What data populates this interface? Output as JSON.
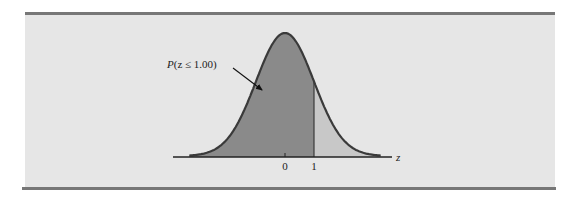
{
  "figure": {
    "annotation": {
      "prefix": "P",
      "text": "(z ≤ 1.00)",
      "full": "P(z ≤ 1.00)"
    },
    "axis": {
      "variable_label": "z",
      "ticks": [
        {
          "label": "0",
          "value": 0
        },
        {
          "label": "1",
          "value": 1
        }
      ]
    },
    "colors": {
      "panel_background": "#e6e6e6",
      "shaded_area": "#8a8a8a",
      "unshaded_area": "#c8c8c8",
      "curve": "#3a3a3a",
      "rules": "#777777"
    }
  },
  "chart_data": {
    "type": "area",
    "title": "",
    "xlabel": "z",
    "ylabel": "",
    "xlim": [
      -3.3,
      3.3
    ],
    "x_ticks": [
      0,
      1
    ],
    "x_tick_labels": [
      "0",
      "1"
    ],
    "distribution": {
      "name": "standard normal",
      "mean": 0,
      "sd": 1
    },
    "shaded_region": {
      "from": "-inf",
      "to": 1.0,
      "label": "P(z ≤ 1.00)",
      "probability": 0.8413
    },
    "unshaded_region": {
      "from": 1.0,
      "to": "inf"
    },
    "annotations": [
      {
        "text": "P(z ≤ 1.00)",
        "arrow_to": "shaded area left of z=1"
      }
    ],
    "grid": false,
    "legend": null
  }
}
